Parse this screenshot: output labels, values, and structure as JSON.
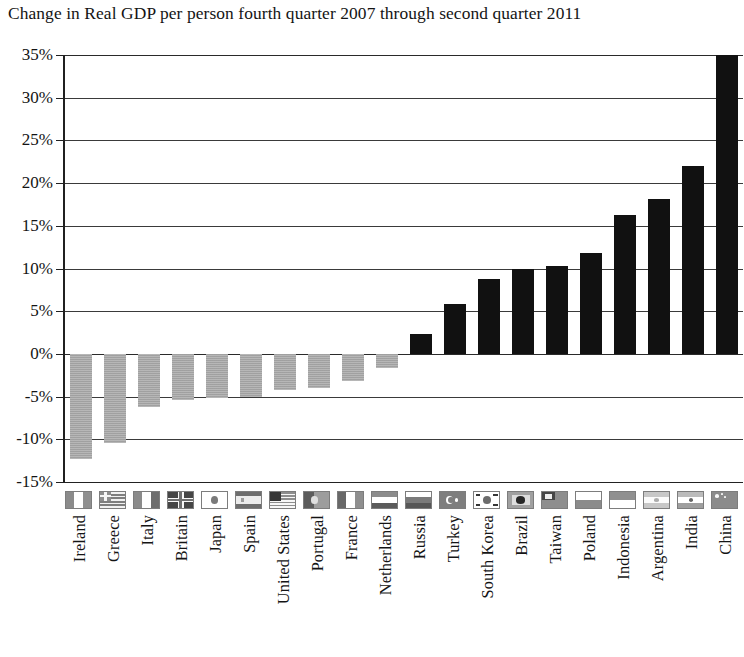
{
  "chart_data": {
    "type": "bar",
    "title": "Change in Real GDP per person fourth quarter 2007 through second quarter 2011",
    "xlabel": "",
    "ylabel": "",
    "ylim": [
      -15,
      35
    ],
    "ytick_step": 5,
    "ytick_labels": [
      "35%",
      "30%",
      "25%",
      "20%",
      "15%",
      "10%",
      "5%",
      "0%",
      "-5%",
      "-10%",
      "-15%"
    ],
    "ytick_values": [
      35,
      30,
      25,
      20,
      15,
      10,
      5,
      0,
      -5,
      -10,
      -15
    ],
    "grid": true,
    "legend": null,
    "value_suffix": "%",
    "negative_color": "#a9a9a9",
    "positive_color": "#111111",
    "categories": [
      "Ireland",
      "Greece",
      "Italy",
      "Britain",
      "Japan",
      "Spain",
      "United States",
      "Portugal",
      "France",
      "Netherlands",
      "Russia",
      "Turkey",
      "South Korea",
      "Brazil",
      "Taiwan",
      "Poland",
      "Indonesia",
      "Argentina",
      "India",
      "China"
    ],
    "values": [
      -12.3,
      -10.4,
      -6.2,
      -5.4,
      -5.2,
      -5.0,
      -4.2,
      -4.0,
      -3.2,
      -1.7,
      2.3,
      5.9,
      8.8,
      10.0,
      10.3,
      11.8,
      16.3,
      18.1,
      22.0,
      35.0
    ],
    "flags": [
      "flag-ireland",
      "flag-greece",
      "flag-italy",
      "flag-britain",
      "flag-japan",
      "flag-spain",
      "flag-united-states",
      "flag-portugal",
      "flag-france",
      "flag-netherlands",
      "flag-russia",
      "flag-turkey",
      "flag-south-korea",
      "flag-brazil",
      "flag-taiwan",
      "flag-poland",
      "flag-indonesia",
      "flag-argentina",
      "flag-india",
      "flag-china"
    ]
  }
}
